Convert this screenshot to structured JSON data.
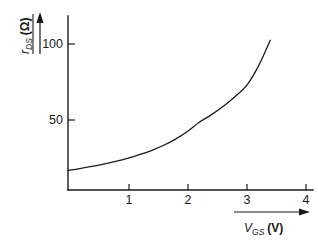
{
  "chart_data": {
    "type": "line",
    "title": "",
    "subtitle": "",
    "xlabel": "V_GS (V)",
    "xlabel_symbol": "V",
    "xlabel_subscript": "GS",
    "xlabel_unit": "(V)",
    "ylabel": "r_DS (Ω)",
    "ylabel_symbol": "r",
    "ylabel_subscript": "DS",
    "ylabel_unit": "(Ω)",
    "xlim": [
      0,
      4.35
    ],
    "ylim": [
      0,
      125
    ],
    "xticks": [
      1,
      2,
      3,
      4
    ],
    "xtick_labels": [
      "1",
      "2",
      "3",
      "4"
    ],
    "yticks": [
      50,
      100
    ],
    "ytick_labels": [
      "50",
      "100"
    ],
    "grid": false,
    "legend": "none",
    "series": [
      {
        "name": "r_DS vs V_GS",
        "color": "#1a1a1a",
        "x": [
          0.0,
          0.2,
          0.4,
          0.6,
          0.8,
          1.0,
          1.2,
          1.4,
          1.6,
          1.8,
          2.0,
          2.2,
          2.4,
          2.6,
          2.8,
          3.0,
          3.2,
          3.4
        ],
        "y": [
          14.0,
          15.3,
          16.8,
          18.5,
          20.4,
          22.6,
          25.2,
          28.2,
          31.8,
          36.2,
          41.6,
          48.2,
          53.5,
          59.5,
          66.5,
          74.5,
          88.5,
          107.0
        ]
      }
    ],
    "curve_endpoint": {
      "x": 3.4,
      "y": 107
    },
    "curve_startpoint": {
      "x": 0.0,
      "y": 14
    },
    "axis_arrows": {
      "x": "right",
      "y": "up"
    },
    "colors": {
      "ink": "#1a1a1a",
      "background": "#ffffff"
    }
  }
}
